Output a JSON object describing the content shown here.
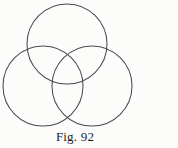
{
  "figure": {
    "caption": "Fig. 92",
    "background_color": "#fcfcfb",
    "stroke_color": "#4c4a4e",
    "diagram_name": "three-overlapping-circles-trefoil"
  },
  "chart_data": {
    "type": "diagram",
    "title": "Fig. 92",
    "shape": "three mutually overlapping circles of equal radius arranged in a trefoil / Venn pattern",
    "units": "pixels",
    "radius": 40,
    "circles": [
      {
        "name": "top-circle",
        "cx": 67,
        "cy": 44,
        "r": 40
      },
      {
        "name": "left-circle",
        "cx": 43,
        "cy": 86,
        "r": 40
      },
      {
        "name": "right-circle",
        "cx": 92,
        "cy": 86,
        "r": 40
      }
    ],
    "stroke_width": 1.05,
    "fill": "none",
    "legend": [],
    "annotations": [
      "Fig. 92"
    ]
  }
}
